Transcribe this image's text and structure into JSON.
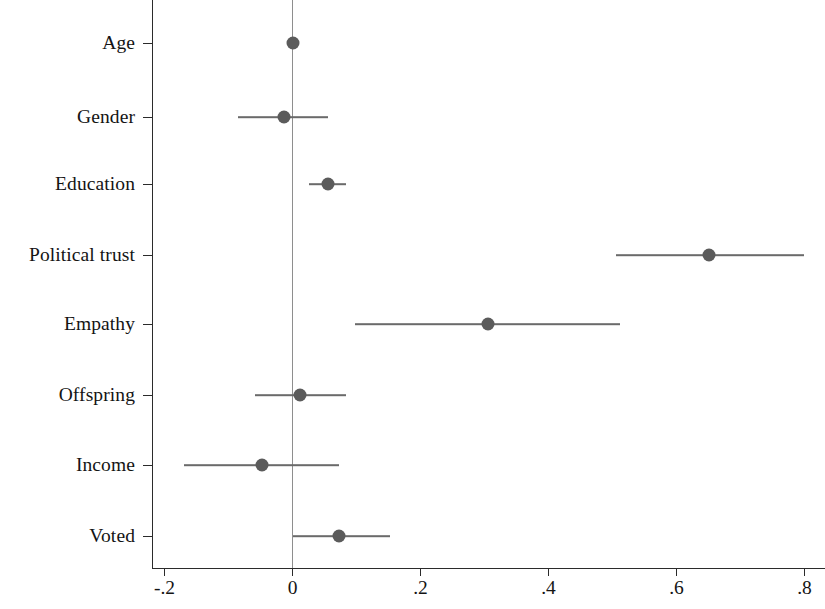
{
  "chart_data": {
    "type": "scatter",
    "subtype": "coefficient-plot",
    "title": "",
    "subtitle": "",
    "xlabel": "",
    "ylabel": "",
    "orientation": "horizontal",
    "grid": false,
    "legend": null,
    "reference_line": {
      "value": 0,
      "orientation": "vertical",
      "color": "#8e8e8e"
    },
    "xlim": [
      -0.2,
      0.8
    ],
    "xticks": [
      -0.2,
      0,
      0.2,
      0.4,
      0.6,
      0.8
    ],
    "xtick_labels": [
      "-.2",
      "0",
      ".2",
      ".4",
      ".6",
      ".8"
    ],
    "categories": [
      "Age",
      "Gender",
      "Education",
      "Political trust",
      "Empathy",
      "Offspring",
      "Income",
      "Voted"
    ],
    "marker_color": "#5b5b5b",
    "whisker_color": "#6a6a6a",
    "points": [
      {
        "label": "Age",
        "estimate": 0.0,
        "ci_low": -0.004,
        "ci_high": 0.004
      },
      {
        "label": "Gender",
        "estimate": -0.014,
        "ci_low": -0.085,
        "ci_high": 0.056
      },
      {
        "label": "Education",
        "estimate": 0.055,
        "ci_low": 0.025,
        "ci_high": 0.083
      },
      {
        "label": "Political trust",
        "estimate": 0.65,
        "ci_low": 0.505,
        "ci_high": 0.8
      },
      {
        "label": "Empathy",
        "estimate": 0.305,
        "ci_low": 0.098,
        "ci_high": 0.512
      },
      {
        "label": "Offspring",
        "estimate": 0.012,
        "ci_low": -0.058,
        "ci_high": 0.083
      },
      {
        "label": "Income",
        "estimate": -0.048,
        "ci_low": -0.17,
        "ci_high": 0.072
      },
      {
        "label": "Voted",
        "estimate": 0.072,
        "ci_low": 0.0,
        "ci_high": 0.152
      }
    ]
  }
}
